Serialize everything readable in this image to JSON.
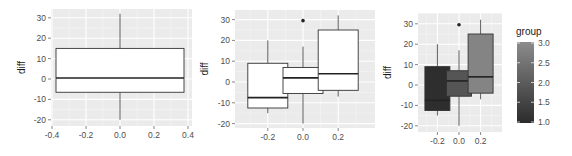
{
  "chart_data": [
    {
      "type": "boxplot",
      "title": "",
      "xlabel": "",
      "ylabel": "diff",
      "xlim": [
        -0.4,
        0.4
      ],
      "ylim": [
        -21,
        33
      ],
      "x_ticks": [
        -0.4,
        -0.2,
        0.0,
        0.2,
        0.4
      ],
      "x_tick_labels": [
        "-0.4",
        "-0.2",
        "0.0",
        "0.2",
        "0.4"
      ],
      "y_ticks": [
        -20,
        -10,
        0,
        10,
        20,
        30
      ],
      "y_tick_labels": [
        "-20",
        "-10",
        "0",
        "10",
        "20",
        "30"
      ],
      "grid": true,
      "boxes": [
        {
          "x": 0.0,
          "width": 0.75,
          "min": -20,
          "q1": -6.5,
          "median": 0.5,
          "q3": 15,
          "max": 32,
          "fill": "#ffffff",
          "outliers": []
        }
      ]
    },
    {
      "type": "boxplot",
      "title": "",
      "xlabel": "",
      "ylabel": "diff",
      "ylim": [
        -21,
        33
      ],
      "x_ticks": [
        -0.2,
        0.0,
        0.2
      ],
      "x_tick_labels": [
        "-0.2",
        "0.0",
        "0.2"
      ],
      "y_ticks": [
        -20,
        -10,
        0,
        10,
        20,
        30
      ],
      "y_tick_labels": [
        "-20",
        "-10",
        "0",
        "10",
        "20",
        "30"
      ],
      "grid": true,
      "boxes": [
        {
          "x": -0.2,
          "group": 1,
          "min": -15,
          "q1": -12.5,
          "median": -7.5,
          "q3": 9,
          "max": 20,
          "fill": "#ffffff",
          "outliers": []
        },
        {
          "x": 0.0,
          "group": 2,
          "min": -20,
          "q1": -5.5,
          "median": 2,
          "q3": 7,
          "max": 17,
          "fill": "#ffffff",
          "outliers": [
            29.5
          ]
        },
        {
          "x": 0.2,
          "group": 3,
          "min": -7,
          "q1": -4,
          "median": 4,
          "q3": 25,
          "max": 32,
          "fill": "#ffffff",
          "outliers": []
        }
      ]
    },
    {
      "type": "boxplot",
      "title": "",
      "xlabel": "",
      "ylabel": "diff",
      "ylim": [
        -21,
        33
      ],
      "x_ticks": [
        -0.2,
        0.0,
        0.2
      ],
      "x_tick_labels": [
        "-0.2",
        "0.0",
        "0.2"
      ],
      "y_ticks": [
        -20,
        -10,
        0,
        10,
        20,
        30
      ],
      "y_tick_labels": [
        "-20",
        "-10",
        "0",
        "10",
        "20",
        "30"
      ],
      "grid": true,
      "boxes": [
        {
          "x": -0.2,
          "group": 1,
          "min": -15,
          "q1": -12.5,
          "median": -7.5,
          "q3": 9,
          "max": 20,
          "fill": "#2e2e2e",
          "outliers": []
        },
        {
          "x": 0.0,
          "group": 2,
          "min": -20,
          "q1": -5.5,
          "median": 2,
          "q3": 7,
          "max": 17,
          "fill": "#555555",
          "outliers": [
            29.5
          ]
        },
        {
          "x": 0.2,
          "group": 3,
          "min": -7,
          "q1": -4,
          "median": 4,
          "q3": 25,
          "max": 32,
          "fill": "#848484",
          "outliers": []
        }
      ],
      "legend": {
        "title": "group",
        "type": "colorbar",
        "position": "right",
        "range": [
          1.0,
          3.0
        ],
        "tick_labels": [
          "3.0",
          "2.5",
          "2.0",
          "1.5",
          "1.0"
        ],
        "color_low": "#2b2b2b",
        "color_high": "#8c8c8c"
      }
    }
  ],
  "labels": {
    "ylabel": "diff",
    "legend_title": "group"
  }
}
